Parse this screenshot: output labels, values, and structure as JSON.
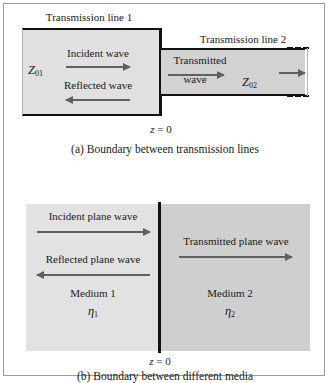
{
  "figure": {
    "title_semantic": "reflection-and-transmission-at-a-boundary",
    "colors": {
      "frame_border": "#9a9a9a",
      "line_black": "#111111",
      "arrow_gray": "#5f5f5f",
      "region_light": "#e0e0e0",
      "region_mid": "#d2d2d2",
      "medium1_fill": "#e2e2e2",
      "medium2_fill": "#cfcfcf",
      "text": "#1a1a1a"
    }
  },
  "panel_a": {
    "caption": "(a)  Boundary between transmission lines",
    "line1_label": "Transmission line 1",
    "line2_label": "Transmission line 2",
    "impedance1": "Z",
    "impedance1_sub": "01",
    "impedance2": "Z",
    "impedance2_sub": "02",
    "incident_label": "Incident wave",
    "reflected_label": "Reflected wave",
    "transmitted_label_line1": "Transmitted",
    "transmitted_label_line2": "wave",
    "boundary_label": "z",
    "boundary_eq": " = 0",
    "arrows": [
      {
        "name": "incident-wave-arrow",
        "direction": "right"
      },
      {
        "name": "reflected-wave-arrow",
        "direction": "left"
      },
      {
        "name": "transmitted-wave-arrow",
        "direction": "right"
      },
      {
        "name": "outgoing-wave-arrow",
        "direction": "right"
      }
    ]
  },
  "panel_b": {
    "caption": "(b)  Boundary between different media",
    "incident_label": "Incident plane wave",
    "reflected_label": "Reflected plane wave",
    "transmitted_label": "Transmitted plane wave",
    "medium1_label": "Medium 1",
    "medium1_eta": "η",
    "medium1_eta_sub": "1",
    "medium2_label": "Medium 2",
    "medium2_eta": "η",
    "medium2_eta_sub": "2",
    "boundary_label": "z",
    "boundary_eq": " = 0",
    "arrows": [
      {
        "name": "incident-plane-wave-arrow",
        "direction": "right"
      },
      {
        "name": "reflected-plane-wave-arrow",
        "direction": "left"
      },
      {
        "name": "transmitted-plane-wave-arrow",
        "direction": "right"
      }
    ]
  }
}
